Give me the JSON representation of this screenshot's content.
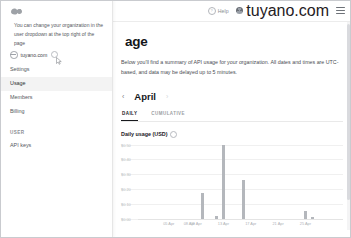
{
  "topbar": {
    "help_label": "Help",
    "help_icon": "question-circle-icon",
    "org_name": "tuyano.com",
    "menu_icon": "hamburger-menu-icon",
    "logo_icon": "brand-logo-icon"
  },
  "sidebar": {
    "logo_icon": "brand-logo-icon",
    "hint_text": "You can change your organization in the user dropdown at the top right of the page",
    "org_name": "tuyano.com",
    "org_icon": "organization-icon",
    "caret_icon": "chevron-down-icon",
    "items": [
      {
        "label": "Settings",
        "active": false
      },
      {
        "label": "Usage",
        "active": true
      },
      {
        "label": "Members",
        "active": false
      },
      {
        "label": "Billing",
        "active": false
      }
    ],
    "section_user": "USER",
    "user_items": [
      {
        "label": "API keys",
        "active": false
      }
    ],
    "cursor_icon": "mouse-cursor-icon"
  },
  "main": {
    "title": "age",
    "description": "Below you'll find a summary of API usage for your organization. All dates and times are UTC-based, and data may be delayed up to 5 minutes.",
    "month_prev_icon": "chevron-left-icon",
    "month_next_icon": "chevron-right-icon",
    "month": "April",
    "tabs": [
      {
        "label": "DAILY",
        "active": true
      },
      {
        "label": "CUMULATIVE",
        "active": false
      }
    ],
    "chart_title": "Daily usage (USD)",
    "chart_info_icon": "info-circle-icon"
  },
  "chart_data": {
    "type": "bar",
    "title": "Daily usage (USD)",
    "xlabel": "",
    "ylabel": "",
    "ylim": [
      0,
      0.5
    ],
    "grid": true,
    "legend": "none",
    "bar_color": "#b4b7bc",
    "ytick_labels": [
      "$0.50",
      "$0.40",
      "$0.30",
      "$0.20",
      "$0.10",
      "$0.00"
    ],
    "ytick_values": [
      0.5,
      0.4,
      0.3,
      0.2,
      0.1,
      0.0
    ],
    "xtick_labels": [
      "05 Apr",
      "08 Apr",
      "09 Apr",
      "13 Apr",
      "17 Apr",
      "21 Apr",
      "25 Apr"
    ],
    "categories": [
      "01 Apr",
      "02 Apr",
      "03 Apr",
      "04 Apr",
      "05 Apr",
      "06 Apr",
      "07 Apr",
      "08 Apr",
      "09 Apr",
      "10 Apr",
      "11 Apr",
      "12 Apr",
      "13 Apr",
      "14 Apr",
      "15 Apr",
      "16 Apr",
      "17 Apr",
      "18 Apr",
      "19 Apr",
      "20 Apr",
      "21 Apr",
      "22 Apr",
      "23 Apr",
      "24 Apr",
      "25 Apr",
      "26 Apr",
      "27 Apr",
      "28 Apr",
      "29 Apr",
      "30 Apr"
    ],
    "values": [
      0,
      0,
      0,
      0,
      0,
      0,
      0,
      0,
      0,
      0.17,
      0,
      0.02,
      0.5,
      0,
      0,
      0.26,
      0,
      0,
      0,
      0,
      0,
      0,
      0,
      0,
      0.05,
      0.01,
      0,
      0,
      0,
      0
    ]
  }
}
